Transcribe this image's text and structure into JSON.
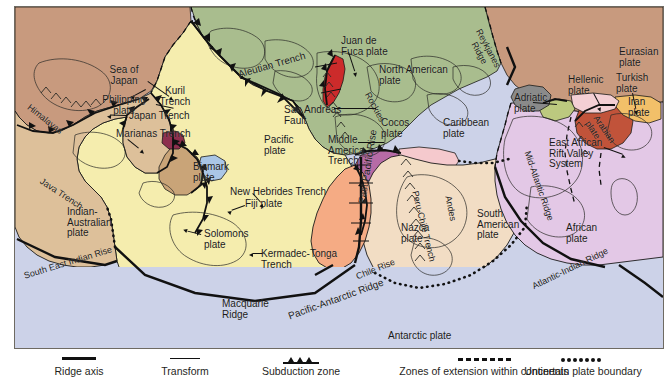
{
  "figure": {
    "kind": "tectonic-plate-map",
    "frame_border_color": "#6e6a62"
  },
  "ocean_color": "#ccd2e8",
  "plates": [
    {
      "id": "eurasian",
      "name": "Eurasian plate",
      "color": "#c89a7e"
    },
    {
      "id": "north-american",
      "name": "North American plate",
      "color": "#a9bd8e"
    },
    {
      "id": "pacific",
      "name": "Pacific plate",
      "color": "#f5edae"
    },
    {
      "id": "philippine",
      "name": "Philipping plate",
      "color": "#5f7a55"
    },
    {
      "id": "indian-australian",
      "name": "Indian-Australian plate",
      "color": "#ddc09a"
    },
    {
      "id": "african",
      "name": "African plate",
      "color": "#e3c8e6"
    },
    {
      "id": "south-american",
      "name": "South American plate",
      "color": "#f2ddc4"
    },
    {
      "id": "antarctic",
      "name": "Antarctic plate",
      "color": "#ccd2e8"
    },
    {
      "id": "nazca",
      "name": "Nazca plate",
      "color": "#f5ab84"
    },
    {
      "id": "cocos",
      "name": "Cocos plate",
      "color": "#b66ba6"
    },
    {
      "id": "caribbean",
      "name": "Caribbean plate",
      "color": "#f5c9cd"
    },
    {
      "id": "juan-de-fuca",
      "name": "Juan de Fuca plate",
      "color": "#cc2b2b"
    },
    {
      "id": "arabian",
      "name": "Arabian plate",
      "color": "#c1533a"
    },
    {
      "id": "iran",
      "name": "Iran plate",
      "color": "#f2c069"
    },
    {
      "id": "turkish",
      "name": "Turkish plate",
      "color": "#f3cfd4"
    },
    {
      "id": "hellenic",
      "name": "Hellenic plate",
      "color": "#bcc97f"
    },
    {
      "id": "adriatic",
      "name": "Adriatic plate",
      "color": "#8a8a8a"
    },
    {
      "id": "fiji",
      "name": "Fiji plate",
      "color": "#aac6e6"
    },
    {
      "id": "solomons",
      "name": "Solomons plate",
      "color": "#c9a478"
    },
    {
      "id": "bismark",
      "name": "Bismark plate",
      "color": "#8e2f4e"
    }
  ],
  "map_labels": {
    "sea_of_japan": "Sea of\nJapan",
    "philippine_plate": "Philipping\nplate",
    "himalayas": "Himalayas",
    "java_trench": "Java Trench",
    "indian_australian": "Indian-\nAustralian\nplate",
    "south_east_indian": "South East Indian Rise",
    "kuril_trench": "Kuril\nTrench",
    "japan_trench": "Japan Trench",
    "marianas_trench": "Marianas Trench",
    "aleutian_trench": "Aleutian Trench",
    "bismark_plate": "Bismark\nplate",
    "new_hebrides": "New Hebrides Trench",
    "fiji_plate": "Fiji plate",
    "solomons_plate": "Solomons\nplate",
    "kermadec_tonga": "Kermadec-Tonga\nTrench",
    "macquarie_ridge": "Macquarie\nRidge",
    "pacific_plate": "Pacific\nplate",
    "san_andreas": "San Andreas\nFault",
    "juan_de_fuca": "Juan de\nFuca plate",
    "north_american": "North American\nplate",
    "rockies": "Rockies",
    "cocos_plate": "Cocos\nplate",
    "caribbean_plate": "Caribbean\nplate",
    "middle_america": "Middle\nAmerica\nTrench",
    "east_pacific_rise": "East Pacific Rise",
    "pacific_antarctic": "Pacific-Antarctic Ridge",
    "nazca_plate": "Nazca\nplate",
    "peru_chile_trench": "Peru-Chile Trench",
    "andes": "Andes",
    "chile_rise": "Chile Rise",
    "south_american": "South\nAmerican\nplate",
    "antarctic_plate": "Antarctic plate",
    "mid_atlantic_ridge": "Mid-Atlantic Ridge",
    "reykjanes_ridge": "Reykjanes\nRidge",
    "eurasian_plate": "Eurasian\nplate",
    "turkish_plate": "Turkish\nplate",
    "iran_plate": "Iran\nplate",
    "hellenic_plate": "Hellenic\nplate",
    "adriatic_plate": "Adriatic\nplate",
    "arabian_plate": "Arabian\nplate",
    "east_african_rift": "East African\nRift Valley\nSystem",
    "african_plate": "African\nplate",
    "atlantic_indian": "Atlantic-Indian Ridge"
  },
  "legend": {
    "items": [
      {
        "id": "ridge-axis",
        "symbol": "thick-solid-line",
        "label": "Ridge axis"
      },
      {
        "id": "transform",
        "symbol": "thin-solid-line",
        "label": "Transform"
      },
      {
        "id": "subduction",
        "symbol": "line-with-teeth",
        "label": "Subduction zone"
      },
      {
        "id": "extension",
        "symbol": "dashed-line",
        "label": "Zones of extension within continents"
      },
      {
        "id": "uncertain",
        "symbol": "dotted-line",
        "label": "Uncertain plate boundary"
      }
    ]
  }
}
